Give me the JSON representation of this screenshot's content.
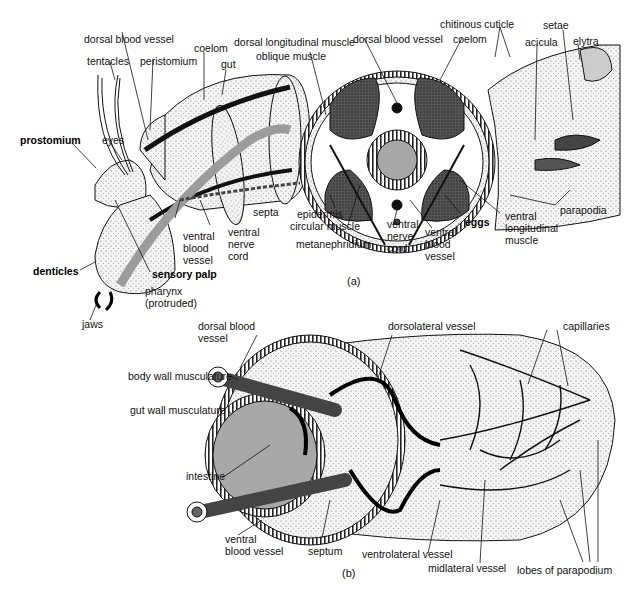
{
  "figure_a": {
    "caption": "(a)",
    "labels": {
      "dorsal_blood_vessel_left": "dorsal blood vessel",
      "tentacles": "tentacles",
      "peristomium": "peristomium",
      "coelom_left": "coelom",
      "gut_left": "gut",
      "prostomium": "prostomium",
      "eyes": "eyes",
      "dorsal_longitudinal_muscle": "dorsal longitudinal muscle",
      "oblique_muscle": "oblique muscle",
      "dorsal_blood_vessel_center": "dorsal blood vessel",
      "coelom_center": "coelom",
      "chitinous_cuticle": "chitinous cuticle",
      "acicula": "acicula",
      "setae": "setae",
      "elytra": "elytra",
      "gut_center": "gut",
      "septa": "septa",
      "ventral_blood_vessel_left": "ventral blood vessel",
      "ventral_nerve_cord_left": "ventral nerve cord",
      "denticles": "denticles",
      "sensory_palp": "sensory palp",
      "pharynx": "pharynx (protruded)",
      "jaws": "jaws",
      "epidermis": "epidermis",
      "circular_muscle": "circular muscle",
      "metanephridium": "metanephridium",
      "ventral_nerve_cord_center": "ventral nerve cord",
      "ventral_blood_vessel_center": "ventral blood vessel",
      "eggs": "eggs",
      "ventral_longitudinal_muscle": "ventral longitudinal muscle",
      "parapodia": "parapodia"
    }
  },
  "figure_b": {
    "caption": "(b)",
    "labels": {
      "dorsal_blood_vessel": "dorsal blood vessel",
      "dorsolateral_vessel": "dorsolateral vessel",
      "capillaries": "capillaries",
      "body_wall_musculature": "body wall musculature",
      "gut_wall_musculature": "gut wall musculature",
      "intestine": "intestine",
      "ventral_blood_vessel": "ventral blood vessel",
      "septum": "septum",
      "ventrolateral_vessel": "ventrolateral vessel",
      "midlateral_vessel": "midlateral vessel",
      "lobes_of_parapodium": "lobes of parapodium"
    }
  },
  "colors": {
    "ink": "#111111",
    "gut_gray": "#a8a8a8",
    "muscle_dark": "#3a3a3a",
    "stipple": "#d9d9d9"
  }
}
